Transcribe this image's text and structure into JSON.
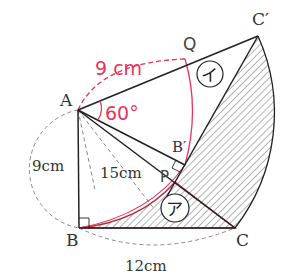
{
  "diagram": {
    "type": "geometry-rotation",
    "colors": {
      "ink": "#222222",
      "dashed": "#888888",
      "annotation": "#e8335a",
      "hatch": "#555555",
      "triangle_highlight": "#b03040",
      "background": "#ffffff"
    },
    "points": {
      "A": {
        "label": "A"
      },
      "B": {
        "label": "B"
      },
      "C": {
        "label": "C"
      },
      "B_prime": {
        "label": "B′"
      },
      "C_prime": {
        "label": "C′"
      },
      "P": {
        "label": "P"
      },
      "Q": {
        "label": "Q"
      }
    },
    "measures": {
      "AB": "9cm",
      "AC": "15cm",
      "BC": "12cm",
      "AQ": "9 cm",
      "angle": "60°"
    },
    "regions": {
      "a": "ア",
      "i": "イ"
    }
  }
}
